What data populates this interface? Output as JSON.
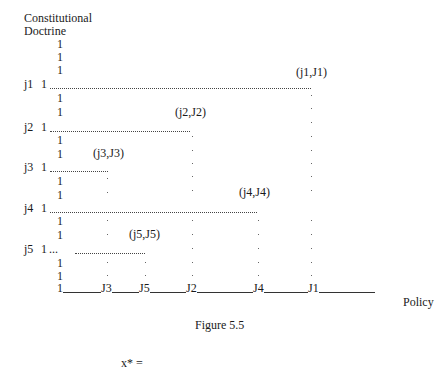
{
  "figure": {
    "y_axis_label_line1": "Constitutional",
    "y_axis_label_line2": "Doctrine",
    "x_axis_label": "Policy",
    "caption": "Figure 5.5",
    "equation": "x* =",
    "axis_tick_glyph": "1",
    "rows": [
      {
        "label": "j1",
        "point": "(j1,J1)"
      },
      {
        "label": "j2",
        "point": "(j2,J2)"
      },
      {
        "label": "j3",
        "point": "(j3,J3)"
      },
      {
        "label": "j4",
        "point": "(j4,J4)"
      },
      {
        "label": "j5",
        "point": "(j5,J5)",
        "prefix": "..."
      }
    ],
    "x_ticks": [
      "J3",
      "J5",
      "J2",
      "J4",
      "J1"
    ]
  }
}
